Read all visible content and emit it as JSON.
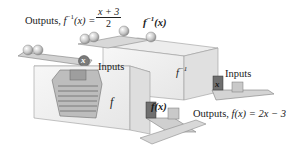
{
  "figure": {
    "labels": {
      "inverse_output_prefix": "Outputs, ",
      "inverse_output_fn": "f",
      "inverse_output_sup": "−1",
      "inverse_output_arg": "(x) =",
      "inverse_formula_numerator": "x + 3",
      "inverse_formula_denominator": "2",
      "inverse_machine_top": "f",
      "inverse_machine_top_sup": "−1",
      "inverse_machine_top_arg": "(x)",
      "inverse_machine_face": "f",
      "inverse_machine_face_sup": "−1",
      "inputs_left": "Inputs",
      "inputs_right": "Inputs",
      "ball_input_var": "x",
      "block_input_var": "x",
      "f_machine_face": "f",
      "f_output_block": "f(x)",
      "f_output_prefix": "Outputs, ",
      "f_output_formula": "f(x) = 2x − 3"
    },
    "colors": {
      "machine_face": "#f4f4f4",
      "machine_side": "#e2e2e2",
      "machine_edge": "#9a9a9a",
      "tray": "#d6d6d6",
      "ball": "#cfcfcf",
      "dark_block": "#6f6f6f"
    }
  }
}
